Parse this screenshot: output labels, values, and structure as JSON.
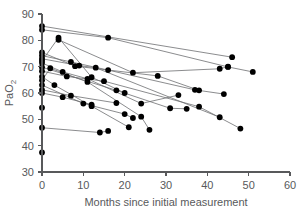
{
  "chart_data": {
    "type": "line",
    "title": "",
    "xlabel": "Months since initial measurement",
    "ylabel": "PaO2",
    "ylabel_base": "PaO",
    "ylabel_sub": "2",
    "xlim": [
      0,
      60
    ],
    "ylim": [
      30,
      90
    ],
    "xticks": [
      0,
      10,
      20,
      30,
      40,
      50,
      60
    ],
    "yticks": [
      30,
      40,
      50,
      60,
      70,
      80,
      90
    ],
    "xtick_labels": [
      "0",
      "10",
      "20",
      "30",
      "40",
      "50",
      "60"
    ],
    "ytick_labels": [
      "30",
      "40",
      "50",
      "60",
      "70",
      "80",
      "90"
    ],
    "grid": false,
    "legend": "none",
    "marker": "filled-circle",
    "marker_color": "#000000",
    "line_color": "#6d6e71",
    "axis_color": "#58595b",
    "series": [
      {
        "name": "patient-1",
        "x": [
          0,
          46
        ],
        "values": [
          85.4,
          73.6
        ]
      },
      {
        "name": "patient-2",
        "x": [
          0,
          16,
          45,
          51
        ],
        "values": [
          84.0,
          81.0,
          69.9,
          68.0
        ]
      },
      {
        "name": "patient-3",
        "x": [
          4,
          22,
          43,
          45
        ],
        "values": [
          80.2,
          67.7,
          69.2,
          70.0
        ]
      },
      {
        "name": "patient-4",
        "x": [
          0,
          8,
          28,
          38
        ],
        "values": [
          75.4,
          70.2,
          66.5,
          61.0
        ]
      },
      {
        "name": "patient-5",
        "x": [
          0,
          7,
          16,
          37,
          44
        ],
        "values": [
          74.2,
          71.8,
          68.7,
          61.2,
          59.6
        ]
      },
      {
        "name": "patient-6",
        "x": [
          0,
          9,
          13,
          43
        ],
        "values": [
          73.0,
          70.4,
          69.6,
          50.8
        ]
      },
      {
        "name": "patient-7",
        "x": [
          0,
          4,
          12,
          20
        ],
        "values": [
          72.2,
          81.0,
          66.0,
          60.0
        ]
      },
      {
        "name": "patient-8",
        "x": [
          0,
          5,
          11,
          24,
          33
        ],
        "values": [
          71.4,
          68.0,
          65.4,
          56.0,
          59.2
        ]
      },
      {
        "name": "patient-9",
        "x": [
          0,
          18,
          31,
          35
        ],
        "values": [
          69.8,
          61.0,
          54.2,
          54.0
        ]
      },
      {
        "name": "patient-10",
        "x": [
          0,
          6,
          15,
          38,
          48
        ],
        "values": [
          68.3,
          66.3,
          64.5,
          54.8,
          46.5
        ]
      },
      {
        "name": "patient-11",
        "x": [
          0,
          3,
          12,
          21
        ],
        "values": [
          66.2,
          63.0,
          55.0,
          47.0
        ]
      },
      {
        "name": "patient-12",
        "x": [
          0,
          2,
          11,
          24,
          26
        ],
        "values": [
          64.8,
          69.4,
          64.2,
          51.0,
          46.0
        ]
      },
      {
        "name": "patient-13",
        "x": [
          0,
          10,
          20,
          22
        ],
        "values": [
          63.0,
          56.0,
          52.0,
          50.5
        ]
      },
      {
        "name": "patient-14",
        "x": [
          0,
          7,
          18
        ],
        "values": [
          61.2,
          59.0,
          56.2
        ]
      },
      {
        "name": "patient-15",
        "x": [
          0,
          5,
          12
        ],
        "values": [
          60.0,
          58.4,
          55.6
        ]
      },
      {
        "name": "patient-16",
        "x": [
          0,
          14,
          16
        ],
        "values": [
          46.8,
          45.0,
          45.6
        ]
      },
      {
        "name": "patient-17",
        "x": [
          0
        ],
        "values": [
          54.4
        ]
      },
      {
        "name": "patient-18",
        "x": [
          0
        ],
        "values": [
          37.4
        ]
      }
    ]
  }
}
